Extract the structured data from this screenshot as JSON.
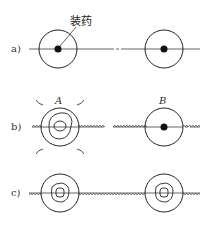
{
  "figure": {
    "charge_label": "装药",
    "rows": [
      {
        "label": "a)"
      },
      {
        "label": "b)",
        "left_point": "A",
        "right_point": "B"
      },
      {
        "label": "c)"
      }
    ],
    "colors": {
      "stroke": "#222222",
      "crack": "#555555"
    }
  }
}
